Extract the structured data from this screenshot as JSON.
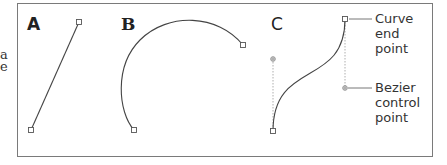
{
  "figure": {
    "cut_text": [
      "a",
      "e"
    ],
    "panels": [
      {
        "id": "A",
        "label": "A",
        "type": "straight-segment",
        "anchors": [
          [
            31,
            130
          ],
          [
            79,
            22
          ]
        ]
      },
      {
        "id": "B",
        "label": "B",
        "type": "arc",
        "anchors": [
          [
            134,
            130
          ],
          [
            243,
            45
          ]
        ]
      },
      {
        "id": "C",
        "label": "C",
        "type": "bezier-curve",
        "anchors": [
          [
            273,
            131
          ],
          [
            345,
            19
          ]
        ],
        "control_points": [
          [
            273,
            59
          ],
          [
            345,
            88
          ]
        ]
      }
    ],
    "callouts": {
      "curve_end_point": [
        "Curve",
        "end",
        "point"
      ],
      "bezier_control_point": [
        "Bezier",
        "control",
        "point"
      ]
    },
    "colors": {
      "frame": "#7a7a7a",
      "stroke": "#444444",
      "guide": "#9a9a9a",
      "text": "#333333"
    }
  }
}
